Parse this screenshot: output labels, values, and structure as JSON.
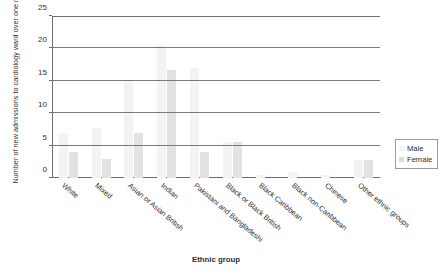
{
  "chart_data": {
    "type": "bar",
    "title": "",
    "xlabel": "Ethnic group",
    "ylabel": "Number of new admissions to cardiology ward over one month",
    "ylim": [
      0,
      25
    ],
    "yticks": [
      0,
      5,
      10,
      15,
      20,
      25
    ],
    "grid": true,
    "legend_position": "right",
    "categories": [
      "White",
      "Mixed",
      "Asian or Asian British",
      "Indian",
      "Pakistani and Bangladeshi",
      "Black or Black British",
      "Black Caribbean",
      "Black non-Caribbean",
      "Chinese",
      "Other ethnic groups"
    ],
    "series": [
      {
        "name": "Male",
        "color": "#f3f3f3",
        "values": [
          7,
          7.7,
          15,
          20.5,
          17,
          5.6,
          0.5,
          1,
          0.4,
          2.8
        ]
      },
      {
        "name": "Female",
        "color": "#e2e2e2",
        "values": [
          4,
          3,
          7,
          16.7,
          4,
          5.6,
          0,
          0,
          0,
          2.8
        ]
      }
    ]
  },
  "legend": {
    "entries": [
      {
        "label": "Male"
      },
      {
        "label": "Female"
      }
    ]
  }
}
